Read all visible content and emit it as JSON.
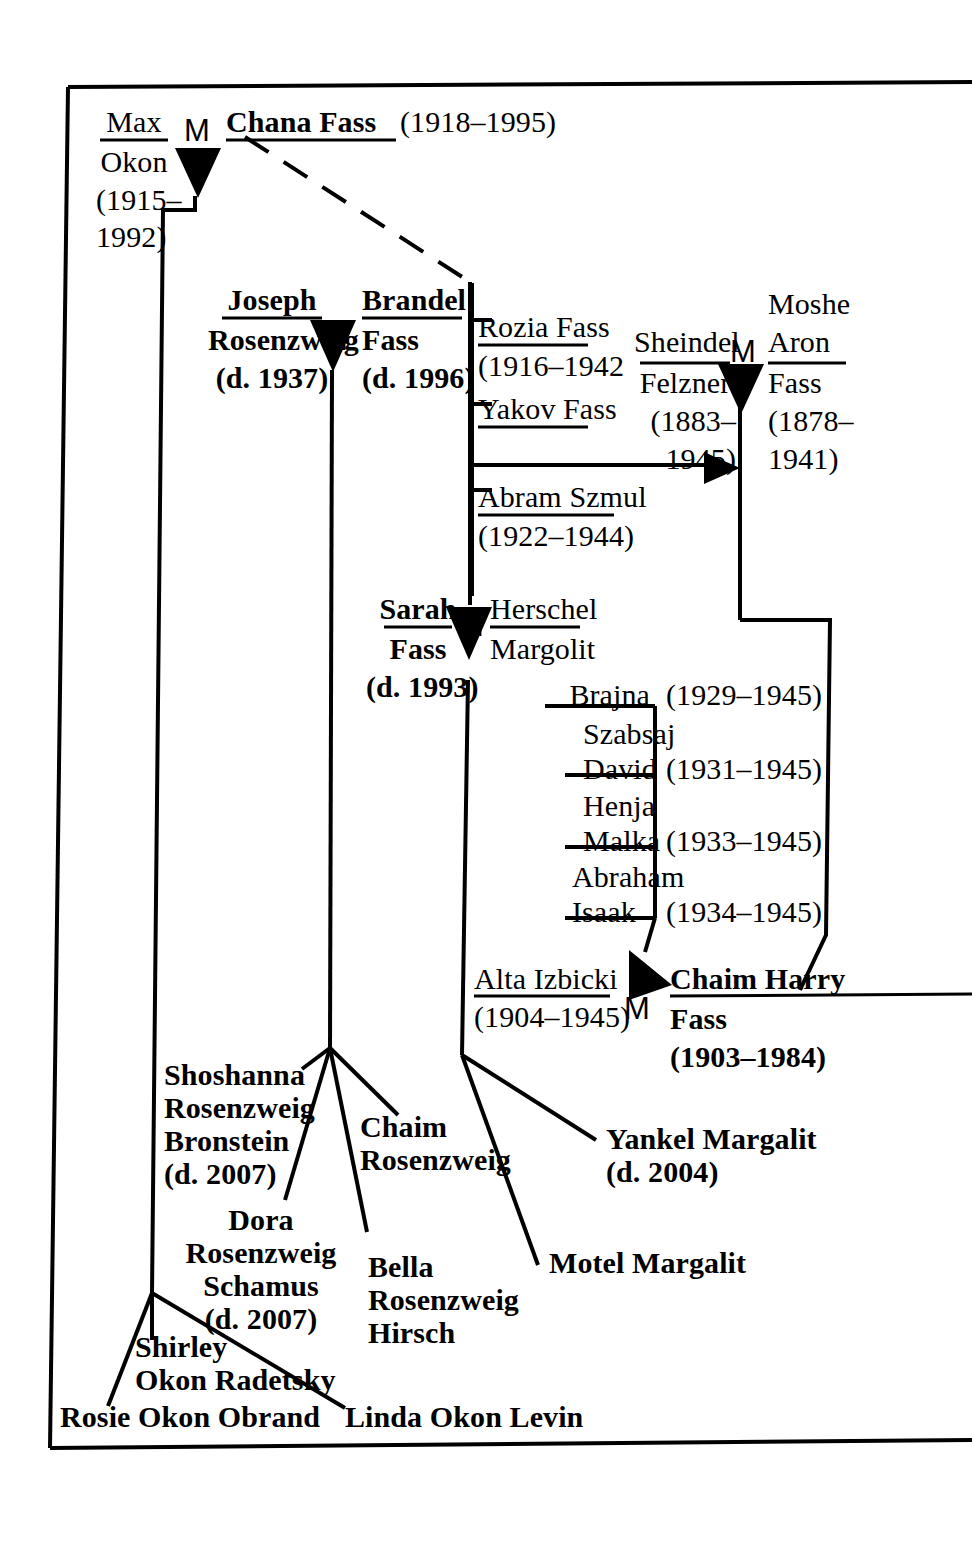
{
  "diagram": {
    "marriage_symbol": "M",
    "line_color": "#000000",
    "background_color": "#ffffff"
  },
  "people": {
    "max_okon": {
      "line1": "Max",
      "line2": "Okon",
      "dates1": "(1915–",
      "dates2": "1992)"
    },
    "chana_fass": {
      "name": "Chana Fass",
      "dates": "(1918–1995)"
    },
    "joseph_rosenzweig": {
      "line1": "Joseph",
      "line2": "Rosenzweig",
      "dates": "(d. 1937)"
    },
    "brandel_fass": {
      "line1": "Brandel",
      "line2": "Fass",
      "dates": "(d. 1996)"
    },
    "rozia_fass": {
      "name": "Rozia Fass",
      "dates": "(1916–1942"
    },
    "yakov_fass": {
      "name": "Yakov Fass"
    },
    "abram_szmul": {
      "name": "Abram Szmul",
      "dates": "(1922–1944)"
    },
    "sheindel_felzner": {
      "line1": "Sheindel",
      "line2": "Felzner",
      "dates1": "(1883–",
      "dates2": "1945)"
    },
    "moshe_aron_fass": {
      "line1": "Moshe",
      "line2": "Aron",
      "line3": "Fass",
      "dates1": "(1878–",
      "dates2": "1941)"
    },
    "sarah_fass": {
      "line1": "Sarah",
      "line2": "Fass",
      "dates": "(d. 1993)"
    },
    "herschel_margolit": {
      "line1": "Herschel",
      "line2": "Margolit"
    },
    "alta_izbicki": {
      "name": "Alta Izbicki",
      "dates": "(1904–1945)"
    },
    "chaim_harry_fass": {
      "line1": "Chaim Harry",
      "line2": "Fass",
      "dates": "(1903–1984)"
    }
  },
  "margolit_children": [
    {
      "name1": "Brajna",
      "name2": "",
      "dates": "(1929–1945)"
    },
    {
      "name1": "Szabsaj",
      "name2": "David",
      "dates": "(1931–1945)"
    },
    {
      "name1": "Henja",
      "name2": "Malka",
      "dates": "(1933–1945)"
    },
    {
      "name1": "Abraham",
      "name2": "Isaak",
      "dates": "(1934–1945)"
    }
  ],
  "rosenzweig_children": [
    {
      "line1": "Shoshanna",
      "line2": "Rosenzweig",
      "line3": "Bronstein",
      "dates": "(d. 2007)"
    },
    {
      "line1": "Dora",
      "line2": "Rosenzweig",
      "line3": "Schamus",
      "dates": "(d. 2007)"
    },
    {
      "line1": "Chaim",
      "line2": "Rosenzweig",
      "line3": "",
      "dates": ""
    },
    {
      "line1": "Bella",
      "line2": "Rosenzweig",
      "line3": "Hirsch",
      "dates": ""
    }
  ],
  "margolit_descendants": [
    {
      "name": "Yankel Margalit",
      "dates": "(d. 2004)"
    },
    {
      "name": "Motel Margalit",
      "dates": ""
    }
  ],
  "okon_children": [
    {
      "line1": "Shirley",
      "line2": "Okon Radetsky"
    },
    {
      "name": "Rosie Okon Obrand"
    },
    {
      "name": "Linda Okon Levin"
    }
  ]
}
